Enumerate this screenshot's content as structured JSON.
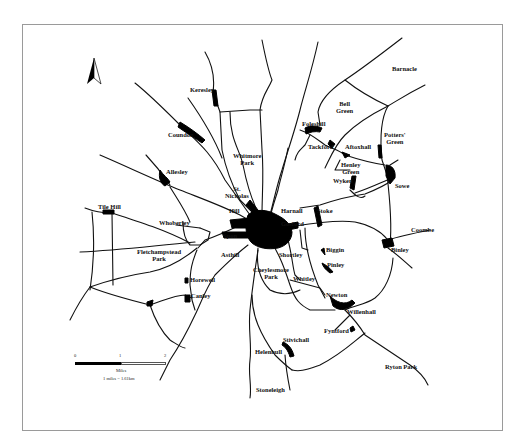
{
  "map": {
    "subject": "Coventry and surrounding villages",
    "north_arrow": "north-arrow-icon",
    "colors": {
      "roads": "#111111",
      "settlements": "#000000",
      "frame": "#9a9a9a",
      "background": "#ffffff"
    },
    "places": {
      "barnacle": "Barnacle",
      "keresley": "Keresley",
      "coundon": "Coundon",
      "bell_green_1": "Bell",
      "bell_green_2": "Green",
      "foleshill": "Foleshill",
      "tackford": "Tackford",
      "aftoxhall": "Aftoxhall",
      "potters_green_1": "Potters'",
      "potters_green_2": "Green",
      "henley_green_1": "Henley",
      "henley_green_2": "Green",
      "wyken": "Wyken",
      "sowe": "Sowe",
      "whitmore_park_1": "Whitmore",
      "whitmore_park_2": "Park",
      "allesley": "Allesley",
      "st_nicholas_1": "St.",
      "st_nicholas_2": "Nicholas",
      "hill": "Hill",
      "harnall": "Harnall",
      "stoke": "Stoke",
      "gosford": "Gosford",
      "tile_hill": "Tile Hill",
      "whoberley": "Whoberley",
      "spon": "Spon",
      "coombe": "Coombe",
      "fletchampstead_1": "Fletchampstead",
      "fletchampstead_2": "Park",
      "asthill": "Asthill",
      "biggin": "Biggin",
      "shortley": "Shortley",
      "binley": "Binley",
      "cheylesmore_1": "Cheylesmore",
      "cheylesmore_2": "Park",
      "pinley": "Pinley",
      "whitley": "Whitley",
      "horewell": "Horewell",
      "canley": "Canley",
      "newton": "Newton",
      "willenhall": "Willenhall",
      "fyntford": "Fyntford",
      "stivichall": "Stivichall",
      "helenhull": "Helenhull",
      "ryton_park": "Ryton Park",
      "stoneleigh": "Stoneleigh"
    },
    "scale_bar": {
      "ticks": [
        "0",
        "1",
        "2"
      ],
      "unit": "Miles",
      "conversion": "1 miles = 1.61km"
    }
  }
}
